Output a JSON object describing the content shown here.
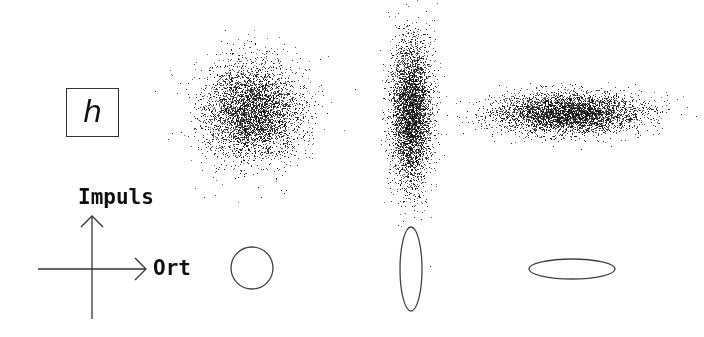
{
  "symbol_box": {
    "symbol": "h"
  },
  "axes": {
    "y_label": "Impuls",
    "x_label": "Ort",
    "origin": [
      92,
      269
    ],
    "x_start": 38,
    "x_end": 146,
    "y_start": 319,
    "y_end": 216,
    "color": "#333333"
  },
  "phase_space_clouds": [
    {
      "name": "circular-cloud",
      "cx": 252,
      "cy": 111,
      "sx": 24,
      "sy": 24,
      "points": 4200
    },
    {
      "name": "vertical-cloud",
      "cx": 411,
      "cy": 112,
      "sx": 10,
      "sy": 36,
      "points": 4200
    },
    {
      "name": "horizontal-cloud",
      "cx": 568,
      "cy": 113,
      "sx": 36,
      "sy": 10,
      "points": 4200
    }
  ],
  "uncertainty_ellipses": [
    {
      "name": "circle-ellipse",
      "cx": 252,
      "cy": 268,
      "rx": 21,
      "ry": 21
    },
    {
      "name": "vertical-ellipse",
      "cx": 411,
      "cy": 269,
      "rx": 11,
      "ry": 42
    },
    {
      "name": "horizontal-ellipse",
      "cx": 572,
      "cy": 269,
      "rx": 43,
      "ry": 10
    }
  ],
  "colors": {
    "dots": "#111111",
    "outline": "#444444",
    "background": "#ffffff"
  }
}
